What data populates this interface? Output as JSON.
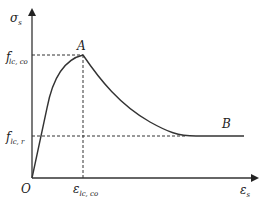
{
  "diagram": {
    "type": "stress-strain curve",
    "y_axis": {
      "symbol": "σ",
      "subscript": "s"
    },
    "x_axis": {
      "symbol": "ε",
      "subscript": "s"
    },
    "origin_label": "O",
    "points": {
      "A": {
        "label": "A",
        "description": "peak"
      },
      "B": {
        "label": "B",
        "description": "residual plateau"
      }
    },
    "y_ticks": [
      {
        "symbol": "f",
        "prime": "′",
        "subscript": "lc, co"
      },
      {
        "symbol": "f",
        "prime": "",
        "subscript": "lc, r"
      }
    ],
    "x_ticks": [
      {
        "symbol": "ε",
        "subscript": "lc, co"
      }
    ],
    "colors": {
      "line": "#333333",
      "text": "#222222"
    }
  }
}
